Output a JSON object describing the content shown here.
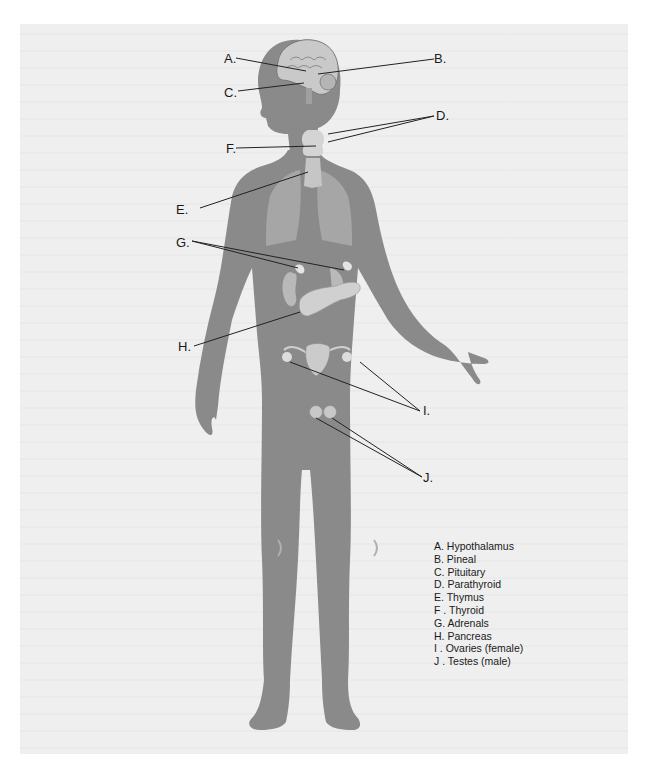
{
  "colors": {
    "background": "#ffffff",
    "panel": "#efefef",
    "body": "#8a8a8a",
    "body_shadow": "#7a7a7a",
    "lungs": "#a8a8a8",
    "organ": "#cfcfcf",
    "leader_line": "#222222",
    "text": "#1a1a1a"
  },
  "labels": {
    "A": "A.",
    "B": "B.",
    "C": "C.",
    "D": "D.",
    "E": "E.",
    "F": "F.",
    "G": "G.",
    "H": "H.",
    "I": "I.",
    "J": "J."
  },
  "legend": [
    {
      "key": "A",
      "text": "A. Hypothalamus"
    },
    {
      "key": "B",
      "text": "B. Pineal"
    },
    {
      "key": "C",
      "text": "C. Pituitary"
    },
    {
      "key": "D",
      "text": "D. Parathyroid"
    },
    {
      "key": "E",
      "text": "E. Thymus"
    },
    {
      "key": "F",
      "text": "F . Thyroid"
    },
    {
      "key": "G",
      "text": "G. Adrenals"
    },
    {
      "key": "H",
      "text": "H. Pancreas"
    },
    {
      "key": "I",
      "text": "I . Ovaries (female)"
    },
    {
      "key": "J",
      "text": "J . Testes (male)"
    }
  ]
}
